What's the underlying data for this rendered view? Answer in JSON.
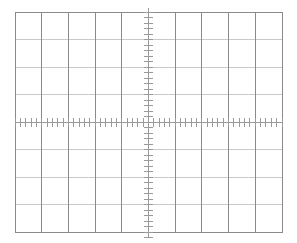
{
  "graticule": {
    "title": "Oscilloscope Graticule",
    "background_color": "#ffffff",
    "geometry": {
      "left": 15,
      "top": 12,
      "right": 282,
      "bottom": 232,
      "width": 267,
      "height": 220,
      "columns": 10,
      "rows": 8,
      "div_width": 26.7,
      "div_height": 27.5,
      "center_x": 148.5,
      "center_y": 122
    },
    "colors": {
      "border": "#8a8a8a",
      "vertical_grid": "#8a8a8a",
      "horizontal_grid": "#c9c9c9",
      "axis": "#9a9a9a",
      "tick": "#9a9a9a"
    },
    "border": {
      "label": "graticule-border",
      "stroke_width": 1
    },
    "vertical_gridlines": {
      "label": "vertical-gridlines",
      "count": 9,
      "positions": [
        41.7,
        68.4,
        95.1,
        121.8,
        148.5,
        175.2,
        201.9,
        228.6,
        255.3
      ],
      "stroke_width": 1
    },
    "horizontal_gridlines": {
      "label": "horizontal-gridlines",
      "count": 7,
      "positions": [
        39.5,
        67,
        94.5,
        122,
        149.5,
        177,
        204.5
      ],
      "stroke_width": 1
    },
    "horizontal_axis": {
      "label": "horizontal-center-axis",
      "y": 122,
      "x_start": 15,
      "x_end": 282,
      "stroke_width": 1
    },
    "vertical_axis": {
      "label": "vertical-center-axis",
      "x": 148.5,
      "y_start": 8,
      "y_end": 238,
      "stroke_width": 1
    },
    "horizontal_ticks": {
      "label": "horizontal-axis-minor-ticks",
      "ticks_per_division": 5,
      "subdivision_value": 0.2,
      "spacing": 5.34,
      "length": 9,
      "stroke_width": 1,
      "total": 50
    },
    "vertical_ticks": {
      "label": "vertical-axis-minor-ticks",
      "ticks_per_division": 5,
      "subdivision_value": 0.2,
      "spacing": 5.5,
      "length": 9,
      "stroke_width": 1,
      "total": 40
    },
    "divisions_label": "10 x 8 divisions"
  },
  "chart_data": {
    "type": "line",
    "subtitle": "",
    "xlabel": "",
    "ylabel": "",
    "xlim": [
      -5,
      5
    ],
    "ylim": [
      -4,
      4
    ],
    "grid": true,
    "legend": false,
    "legend_position": "none",
    "x_major_ticks": [
      -5,
      -4,
      -3,
      -2,
      -1,
      0,
      1,
      2,
      3,
      4,
      5
    ],
    "y_major_ticks": [
      -4,
      -3,
      -2,
      -1,
      0,
      1,
      2,
      3,
      4
    ],
    "x_minor_tick_interval": 0.2,
    "y_minor_tick_interval": 0.2,
    "x_tick_labels": [],
    "y_tick_labels": [],
    "series": [],
    "annotations": []
  }
}
